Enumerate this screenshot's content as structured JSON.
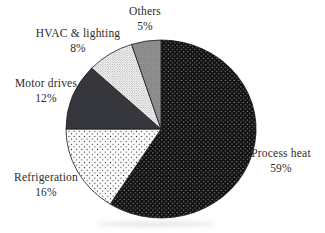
{
  "chart_data": {
    "type": "pie",
    "title": "",
    "direction": "clockwise",
    "start_angle_deg": 0,
    "legend": "none",
    "slices": [
      {
        "label": "Process heat",
        "value": 59,
        "pct_text": "59%",
        "pattern": "black-white-dots"
      },
      {
        "label": "Refrigeration",
        "value": 16,
        "pct_text": "16%",
        "pattern": "white-black-dots"
      },
      {
        "label": "Motor drives",
        "value": 12,
        "pct_text": "12%",
        "pattern": "dark-gray-fine-dots"
      },
      {
        "label": "HVAC & lighting",
        "value": 8,
        "pct_text": "8%",
        "pattern": "light-gray-fine-dots"
      },
      {
        "label": "Others",
        "value": 5,
        "pct_text": "5%",
        "pattern": "medium-gray-fine-dots"
      }
    ],
    "colors": {
      "process_heat_fill": "#101010",
      "process_heat_dot": "#cfcfcf",
      "refrigeration_fill": "#fdfdfd",
      "refrigeration_dot": "#262626",
      "motor_drives_fill": "#33333a",
      "motor_drives_dot": "#45454d",
      "hvac_fill": "#fbfbfb",
      "hvac_dot": "#8a8a8a",
      "others_fill": "#9a9a9a",
      "others_dot": "#606060",
      "outline": "#1a1a1a",
      "label_text": "#2e2b28",
      "background": "#ffffff"
    }
  }
}
